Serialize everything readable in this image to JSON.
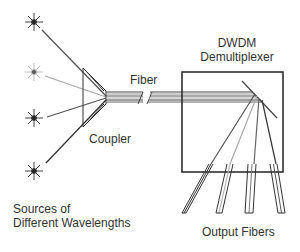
{
  "labels": {
    "fiber": "Fiber",
    "dwdm_line1": "DWDM",
    "dwdm_line2": "Demultiplexer",
    "coupler": "Coupler",
    "sources_line1": "Sources of",
    "sources_line2": "Different Wavelengths",
    "output_fibers": "Output Fibers"
  },
  "colors": {
    "dark": "#333333",
    "light": "#aaaaaa",
    "medium": "#777777"
  }
}
